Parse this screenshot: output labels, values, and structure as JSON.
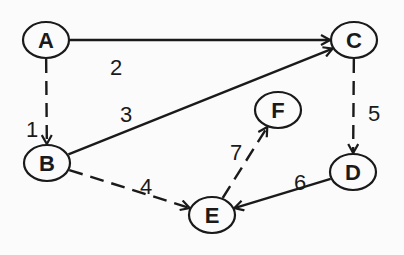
{
  "diagram": {
    "type": "directed-graph",
    "nodes": [
      {
        "id": "A",
        "label": "A"
      },
      {
        "id": "B",
        "label": "B"
      },
      {
        "id": "C",
        "label": "C"
      },
      {
        "id": "D",
        "label": "D"
      },
      {
        "id": "E",
        "label": "E"
      },
      {
        "id": "F",
        "label": "F"
      }
    ],
    "edges": [
      {
        "from": "A",
        "to": "B",
        "label": "1",
        "style": "dashed"
      },
      {
        "from": "A",
        "to": "C",
        "label": "2",
        "style": "solid"
      },
      {
        "from": "B",
        "to": "C",
        "label": "3",
        "style": "solid"
      },
      {
        "from": "B",
        "to": "E",
        "label": "4",
        "style": "dashed"
      },
      {
        "from": "C",
        "to": "D",
        "label": "5",
        "style": "dashed"
      },
      {
        "from": "D",
        "to": "E",
        "label": "6",
        "style": "solid"
      },
      {
        "from": "E",
        "to": "F",
        "label": "7",
        "style": "dashed"
      }
    ],
    "colors": {
      "ink": "#1a1a1a",
      "background": "#fbfbfb"
    }
  }
}
